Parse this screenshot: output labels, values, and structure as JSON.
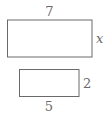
{
  "diagram": {
    "large_rect": {
      "width_label": "7",
      "height_label": "x"
    },
    "small_rect": {
      "width_label": "5",
      "height_label": "2"
    },
    "colors": {
      "stroke": "#6a6a6a",
      "text": "#6a6a6a",
      "background": "#ffffff"
    }
  }
}
